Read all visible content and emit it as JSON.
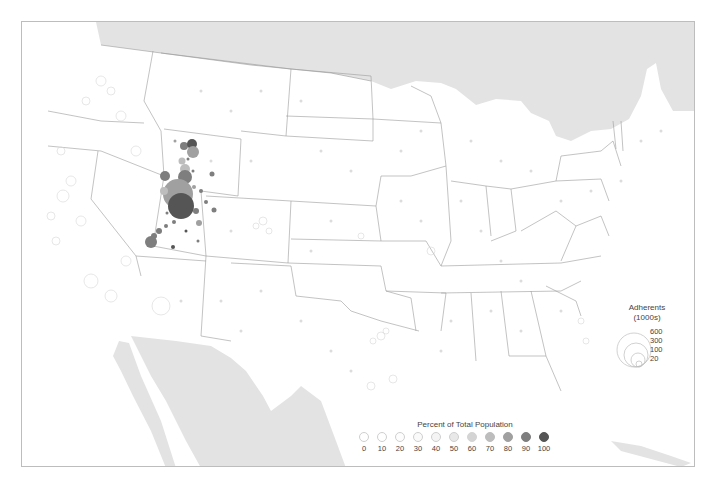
{
  "map": {
    "subject": "Religious adherents by county, continental United States",
    "base_land_color": "#ffffff",
    "foreign_land_color": "#e2e2e2",
    "border_color": "#9a9a9a",
    "highlight_region": "Utah / southern Idaho cluster (darkest, largest circles)"
  },
  "legend_percent": {
    "title": "Percent of Total Population",
    "items": [
      {
        "label": "0",
        "color": "#ffffff"
      },
      {
        "label": "10",
        "color": "#ffffff"
      },
      {
        "label": "20",
        "color": "#fdfdfd"
      },
      {
        "label": "30",
        "color": "#fafafa"
      },
      {
        "label": "40",
        "color": "#f4f4f4"
      },
      {
        "label": "50",
        "color": "#e8e8e8"
      },
      {
        "label": "60",
        "color": "#d4d4d4"
      },
      {
        "label": "70",
        "color": "#bdbdbd"
      },
      {
        "label": "80",
        "color": "#a0a0a0"
      },
      {
        "label": "90",
        "color": "#7e7e7e"
      },
      {
        "label": "100",
        "color": "#555555"
      }
    ]
  },
  "legend_size": {
    "title_line1": "Adherents",
    "title_line2": "(1000s)",
    "items": [
      {
        "label": "600"
      },
      {
        "label": "300"
      },
      {
        "label": "100"
      },
      {
        "label": "20"
      }
    ]
  }
}
